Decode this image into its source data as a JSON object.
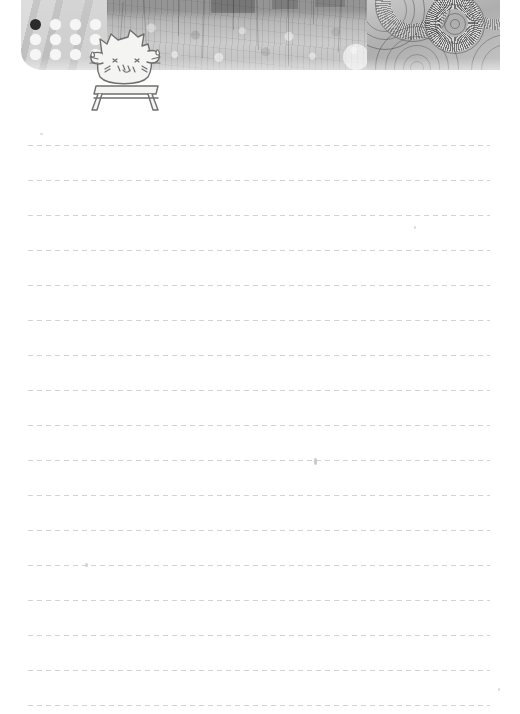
{
  "page": {
    "kind": "lined-notepaper-sheet",
    "width": 520,
    "height": 714,
    "background_color": "#ffffff",
    "alt_text": ""
  },
  "header": {
    "name": "decorative-collage-banner",
    "left": 21,
    "top": 0,
    "width": 479,
    "height": 70,
    "panels": [
      {
        "name": "polka-dot-panel",
        "description": "light gray panel with a 4x3 grid of white dots, top-left dot filled dark",
        "base_color": "#cbcbcb",
        "dot_color": "#f6f6f6",
        "accent_dot_color": "#2b2b2b",
        "dot_columns": 4,
        "dot_rows": 3,
        "dots": [
          "dark",
          "light",
          "light",
          "light",
          "light",
          "light",
          "light",
          "light",
          "light",
          "light",
          "light",
          "light"
        ]
      },
      {
        "name": "foliage-texture-panel",
        "description": "mottled grayscale photo texture of leaves, grass and thin vertical twigs",
        "base_color": "#b9b9b9"
      },
      {
        "name": "concentric-circles-panel",
        "description": "overlapping concentric rings and radial sunburst discs in grayscale",
        "base_color": "#bdbdbd",
        "ring_stroke_color": "#545454"
      }
    ]
  },
  "mascot": {
    "name": "cat-doodle",
    "description": "hand drawn cartoon cat with blush marks, whiskers and short legs, sitting on a low bench",
    "left": 80,
    "top": 24,
    "width": 86,
    "height": 88,
    "fill_color": "#f3f3f1",
    "outline_color": "#6b6b6b"
  },
  "ruled_lines": {
    "name": "writing-lines",
    "style": "dashed",
    "color": "#d2d2d6",
    "dash_length": 5,
    "dash_gap": 4,
    "left": 28,
    "right": 490,
    "width": 462,
    "spacing": 35,
    "count": 17,
    "y_positions": [
      145,
      180,
      215,
      250,
      285,
      320,
      355,
      390,
      425,
      460,
      495,
      530,
      565,
      600,
      635,
      670,
      705
    ]
  },
  "specks": [
    {
      "name": "paper-speck",
      "x": 314,
      "y": 458,
      "width": 3,
      "height": 7,
      "color": "#c9c9cf"
    },
    {
      "name": "paper-speck",
      "x": 85,
      "y": 563,
      "width": 3,
      "height": 4,
      "color": "#d6d6da"
    },
    {
      "name": "paper-speck",
      "x": 414,
      "y": 226,
      "width": 2,
      "height": 3,
      "color": "#dcdce0"
    },
    {
      "name": "paper-speck",
      "x": 40,
      "y": 133,
      "width": 3,
      "height": 2,
      "color": "#dedee2"
    },
    {
      "name": "paper-speck",
      "x": 498,
      "y": 688,
      "width": 2,
      "height": 3,
      "color": "#dedee2"
    }
  ]
}
